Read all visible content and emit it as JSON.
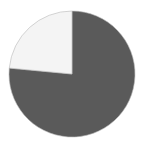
{
  "chart_data": {
    "type": "pie",
    "title": "",
    "categories": [
      "Slice A",
      "Slice B"
    ],
    "values": [
      76.5,
      23.5
    ],
    "colors": [
      "#5a5a5a",
      "#f4f4f4"
    ],
    "start_angle_deg": 0,
    "direction": "clockwise",
    "legend": "none",
    "outline_color": "#b8b8b8"
  },
  "geometry": {
    "cx": 72,
    "cy": 74,
    "r": 63
  }
}
